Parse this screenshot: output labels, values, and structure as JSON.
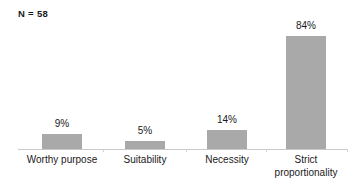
{
  "figure": {
    "sample_size_label": "N = 58",
    "background_color": "#ffffff",
    "bar_color": "#a9a9a9",
    "axis_color": "#c9c9c9",
    "text_color": "#1a1a1a"
  },
  "chart_data": {
    "type": "bar",
    "title": "",
    "subtitle": "",
    "xlabel": "",
    "ylabel": "",
    "annotations": [
      "N = 58"
    ],
    "categories": [
      "Worthy purpose",
      "Suitability",
      "Necessity",
      "Strict proportionality"
    ],
    "values": [
      9,
      5,
      14,
      84
    ],
    "value_labels": [
      "9%",
      "5%",
      "14%",
      "84%"
    ],
    "units": "percent",
    "ylim": [
      0,
      100
    ],
    "grid": false,
    "legend": false
  },
  "bars": [
    {
      "category": "Worthy purpose",
      "value": 9,
      "value_label": "9%",
      "label_lines": [
        "Worthy purpose"
      ],
      "left_px": 42,
      "width_px": 40,
      "height_px": 15,
      "center_px": 62
    },
    {
      "category": "Suitability",
      "value": 5,
      "value_label": "5%",
      "label_lines": [
        "Suitability"
      ],
      "left_px": 125,
      "width_px": 40,
      "height_px": 8,
      "center_px": 145
    },
    {
      "category": "Necessity",
      "value": 14,
      "value_label": "14%",
      "label_lines": [
        "Necessity"
      ],
      "left_px": 207,
      "width_px": 40,
      "height_px": 19,
      "center_px": 227
    },
    {
      "category": "Strict proportionality",
      "value": 84,
      "value_label": "84%",
      "label_lines": [
        "Strict",
        "proportionality"
      ],
      "left_px": 286,
      "width_px": 40,
      "height_px": 113,
      "center_px": 306
    }
  ],
  "ticks_px": [
    103,
    186,
    266,
    347
  ]
}
